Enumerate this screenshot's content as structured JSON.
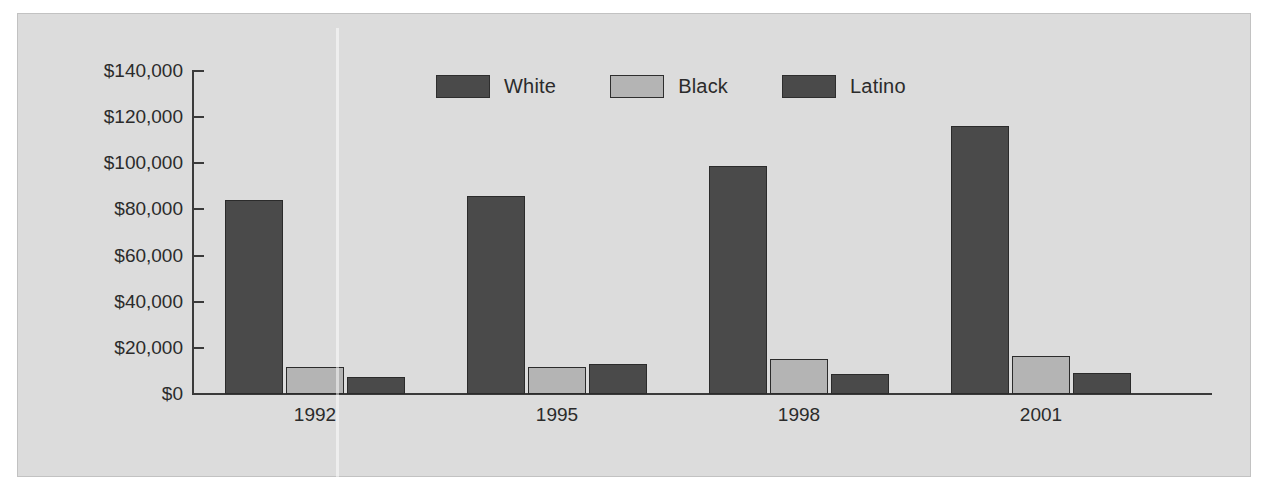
{
  "chart_data": {
    "type": "bar",
    "title": "",
    "subtitle": "",
    "xlabel": "",
    "ylabel": "",
    "categories": [
      "1992",
      "1995",
      "1998",
      "2001"
    ],
    "series": [
      {
        "name": "White",
        "color": "#4a4a4a",
        "values": [
          84000,
          86000,
          99000,
          116000
        ]
      },
      {
        "name": "Black",
        "color": "#b4b4b4",
        "values": [
          11500,
          11500,
          15000,
          16500
        ]
      },
      {
        "name": "Latino",
        "color": "#4a4a4a",
        "values": [
          7500,
          13000,
          8500,
          9000
        ]
      }
    ],
    "ylim": [
      0,
      140000
    ],
    "ytick_values": [
      0,
      20000,
      40000,
      60000,
      80000,
      100000,
      120000,
      140000
    ],
    "ytick_labels": [
      "$0",
      "$20,000",
      "$40,000",
      "$60,000",
      "$80,000",
      "$100,000",
      "$120,000",
      "$140,000"
    ],
    "grid": false,
    "legend_position": "top-center",
    "legend_entries": [
      "White",
      "Black",
      "Latino"
    ]
  },
  "style": {
    "panel_background": "#dcdcdc",
    "page_background": "#ffffff",
    "axis_color": "#3a3a3a",
    "text_color": "#2b2b2b",
    "bar_dark": "#4a4a4a",
    "bar_light": "#b4b4b4",
    "bar_outline": "#2b2b2b"
  },
  "icons": {
    "legend_swatch": "legend-swatch-icon"
  }
}
